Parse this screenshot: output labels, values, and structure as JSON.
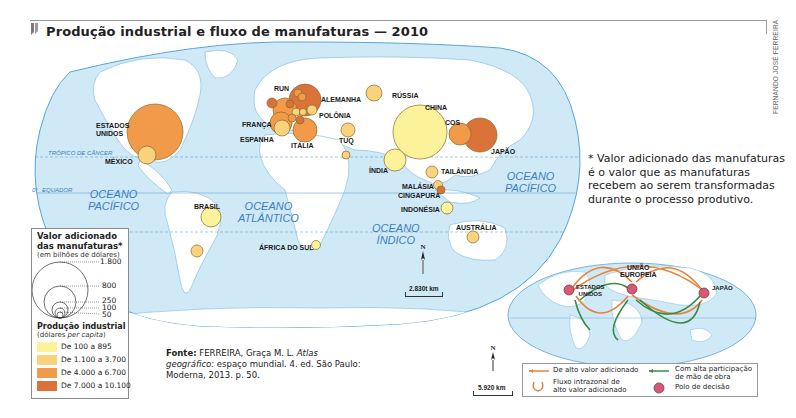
{
  "header": {
    "title": "Produção industrial e fluxo de manufaturas — 2010",
    "credit": "FERNANDO JOSÉ FERREIRA"
  },
  "main_map": {
    "oceans": {
      "pacific_left": [
        "OCEANO",
        "PACÍFICO"
      ],
      "atlantic": [
        "OCEANO",
        "ATLÂNTICO"
      ],
      "indian": [
        "OCEANO",
        "ÍNDICO"
      ],
      "pacific_right": [
        "OCEANO",
        "PACÍFICO"
      ]
    },
    "lines": {
      "tropic": "TRÓPICO DE CÂNCER",
      "equator": "EQUADOR",
      "equator_deg": "0°"
    },
    "countries": [
      {
        "name": "ESTADOS UNIDOS",
        "label": "ESTADOS\nUNIDOS",
        "class": 3,
        "size": "large"
      },
      {
        "name": "MÉXICO",
        "class": 2,
        "size": "medium"
      },
      {
        "name": "BRASIL",
        "class": 1,
        "size": "medium"
      },
      {
        "name": "RUN",
        "class": 3,
        "size": "medium"
      },
      {
        "name": "ALEMANHA",
        "class": 4,
        "size": "large"
      },
      {
        "name": "FRANÇA",
        "class": 3,
        "size": "medium"
      },
      {
        "name": "ESPANHA",
        "class": 2,
        "size": "medium"
      },
      {
        "name": "ITÁLIA",
        "class": 3,
        "size": "medium"
      },
      {
        "name": "POLÔNIA",
        "class": 2,
        "size": "small"
      },
      {
        "name": "TUQ",
        "class": 2,
        "size": "small"
      },
      {
        "name": "RÚSSIA",
        "class": 2,
        "size": "small"
      },
      {
        "name": "CHINA",
        "class": 1,
        "size": "largest"
      },
      {
        "name": "COS",
        "class": 3,
        "size": "medium"
      },
      {
        "name": "JAPÃO",
        "class": 4,
        "size": "large"
      },
      {
        "name": "ÍNDIA",
        "class": 1,
        "size": "medium"
      },
      {
        "name": "TAILÂNDIA",
        "class": 2,
        "size": "small"
      },
      {
        "name": "MALÁSIA",
        "class": 2,
        "size": "small"
      },
      {
        "name": "CINGAPURA",
        "class": 4,
        "size": "small"
      },
      {
        "name": "INDONÉSIA",
        "class": 1,
        "size": "small"
      },
      {
        "name": "AUSTRÁLIA",
        "class": 2,
        "size": "small"
      },
      {
        "name": "ÁFRICA DO SUL",
        "class": 1,
        "size": "small"
      }
    ],
    "scale_label": "2.830t km",
    "north_label": "N"
  },
  "note": "* Valor adicionado das manufaturas é o valor que as manufaturas recebem ao serem transformadas durante o processo produtivo.",
  "legend": {
    "title_line1": "Valor adicionado",
    "title_line2": "das manufaturas*",
    "subtitle": "(em bilhões de dólares)",
    "circle_values": [
      "1.800",
      "800",
      "250",
      "100",
      "50"
    ],
    "production_title": "Produção industrial",
    "production_sub_prefix": "(dólares ",
    "production_sub_italic": "per capita",
    "production_sub_suffix": ")",
    "classes": [
      {
        "label": "De 100 a 895",
        "color": "#fbf29a"
      },
      {
        "label": "De 1.100 a 3.700",
        "color": "#f8d27c"
      },
      {
        "label": "De 4.000 a 6.700",
        "color": "#f09a4a"
      },
      {
        "label": "De 7.000 a 10.100",
        "color": "#d9733a"
      }
    ]
  },
  "source": {
    "bold": "Fonte:",
    "author": " FERREIRA, Graça M. L. ",
    "title_italic": "Atlas geográfico:",
    "rest": " espaço mundial. 4. ed. São Paulo: Moderna, 2013. p. 50."
  },
  "flow_map": {
    "poles": [
      {
        "label": "ESTADOS\nUNIDOS"
      },
      {
        "label": "UNIÃO\nEUROPEIA"
      },
      {
        "label": "JAPÃO"
      }
    ],
    "scale_label": "5.920 km",
    "north_label": "N",
    "legend": {
      "high_value": "De alto valor adicionado",
      "intrazonal_line1": "Fluxo intrazonal de",
      "intrazonal_line2": "alto valor adicionado",
      "labor_line1": "Com alta participação",
      "labor_line2": "de mão de obra",
      "pole": "Polo de decisão"
    }
  },
  "colors": {
    "ocean": "#cfe9f6",
    "land": "#ffffff",
    "border": "#5aa6d6",
    "class1": "#fbf29a",
    "class2": "#f8d27c",
    "class3": "#f09a4a",
    "class4": "#d9733a",
    "flow_orange": "#e8823a",
    "flow_green": "#3a8a4a",
    "pole": "#d45a78"
  }
}
